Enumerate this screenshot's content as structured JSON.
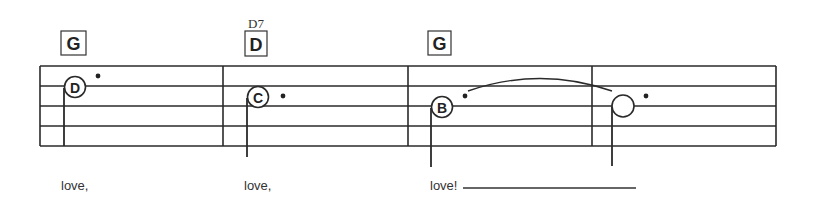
{
  "score": {
    "staff": {
      "left": 40,
      "right": 776,
      "lines_y": [
        66,
        86,
        106,
        126,
        146
      ],
      "barlines_x": [
        40,
        223,
        408,
        592,
        776
      ],
      "color": "#2a2a2a"
    },
    "measures": [
      {
        "chord": "G",
        "alt_chord": "",
        "note": {
          "letter": "D",
          "cx": 75,
          "cy": 87,
          "filled_letter": true,
          "stem_x": 64,
          "stem_top": 87,
          "stem_bottom": 146,
          "dot": {
            "x": 98,
            "y": 76
          }
        },
        "lyric": "love,",
        "lyric_x": 61
      },
      {
        "chord": "D",
        "alt_chord": "D7",
        "note": {
          "letter": "C",
          "cx": 258,
          "cy": 97,
          "filled_letter": true,
          "stem_x": 247,
          "stem_top": 97,
          "stem_bottom": 157,
          "dot": {
            "x": 283,
            "y": 96
          }
        },
        "lyric": "love,",
        "lyric_x": 244
      },
      {
        "chord": "G",
        "alt_chord": "",
        "note": {
          "letter": "B",
          "cx": 442,
          "cy": 107,
          "filled_letter": true,
          "stem_x": 431,
          "stem_top": 107,
          "stem_bottom": 167,
          "dot": {
            "x": 465,
            "y": 96
          }
        },
        "lyric": "love!",
        "lyric_x": 430
      },
      {
        "chord": "",
        "alt_chord": "",
        "note": {
          "letter": "",
          "cx": 623,
          "cy": 106,
          "filled_letter": false,
          "stem_x": 612,
          "stem_top": 106,
          "stem_bottom": 166,
          "dot": {
            "x": 646,
            "y": 96
          }
        },
        "lyric": "",
        "lyric_x": 0
      }
    ],
    "tie": {
      "from_x": 468,
      "from_y": 91,
      "to_x": 612,
      "to_y": 91,
      "peak_y": 78
    },
    "extender_line": {
      "x1": 463,
      "x2": 636,
      "y": 188
    }
  }
}
